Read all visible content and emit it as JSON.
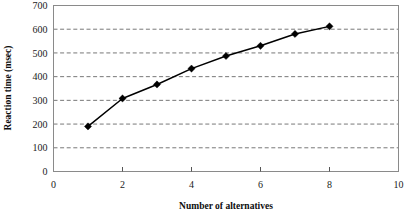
{
  "chart_data": {
    "type": "line",
    "title": "",
    "xlabel": "Number of alternatives",
    "ylabel": "Reaction time (msec)",
    "x": [
      1,
      2,
      3,
      4,
      5,
      6,
      7,
      8
    ],
    "values": [
      190,
      308,
      367,
      434,
      487,
      530,
      580,
      612
    ],
    "series": [
      {
        "name": "Reaction time",
        "values": [
          190,
          308,
          367,
          434,
          487,
          530,
          580,
          612
        ]
      }
    ],
    "xlim": [
      0,
      10
    ],
    "ylim": [
      0,
      700
    ],
    "xticks": [
      0,
      2,
      4,
      6,
      8,
      10
    ],
    "yticks": [
      0,
      100,
      200,
      300,
      400,
      500,
      600,
      700
    ],
    "xtick_labels": [
      "0",
      "2",
      "4",
      "6",
      "8",
      "10"
    ],
    "ytick_labels": [
      "0",
      "100",
      "200",
      "300",
      "400",
      "500",
      "600",
      "700"
    ],
    "grid": "horizontal-dashed",
    "legend": "none",
    "marker": "diamond",
    "line_color": "#000000",
    "grid_color": "#555555",
    "border_color": "#8a8a8a",
    "background": "#ffffff"
  }
}
